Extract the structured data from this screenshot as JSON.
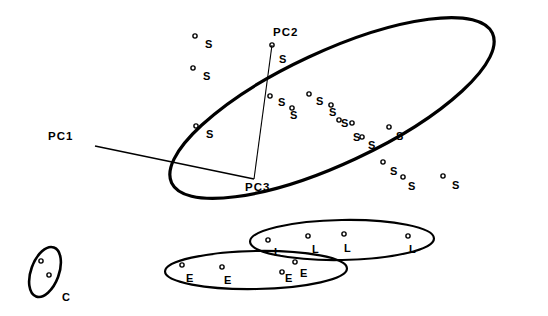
{
  "figure": {
    "background_color": "#ffffff",
    "ink_color": "#000000"
  },
  "axes": [
    {
      "name": "PC1",
      "label": "PC1",
      "label_x": 48,
      "label_y": 131,
      "x1": 95,
      "y1": 146,
      "x2": 254,
      "y2": 179
    },
    {
      "name": "PC2",
      "label": "PC2",
      "label_x": 273,
      "label_y": 27,
      "x1": 272,
      "y1": 45,
      "x2": 254,
      "y2": 179
    },
    {
      "name": "PC3",
      "label": "PC3",
      "label_x": 245,
      "label_y": 182,
      "x1": 254,
      "y1": 179,
      "x2": 254,
      "y2": 179
    }
  ],
  "groups": [
    {
      "name": "spring-group",
      "marker_label": "S",
      "ellipse": {
        "cx": 332,
        "cy": 108,
        "rx": 177,
        "ry": 56,
        "rotation": -25,
        "stroke_width": 3.2
      }
    },
    {
      "name": "late-group",
      "marker_label": "L",
      "ellipse": {
        "cx": 342,
        "cy": 240,
        "rx": 92,
        "ry": 20,
        "rotation": -1,
        "stroke_width": 2.2
      }
    },
    {
      "name": "early-group",
      "marker_label": "E",
      "ellipse": {
        "cx": 256,
        "cy": 270,
        "rx": 91,
        "ry": 19,
        "rotation": -1,
        "stroke_width": 2.2
      }
    },
    {
      "name": "control-group",
      "marker_label": "C",
      "ellipse": {
        "cx": 45,
        "cy": 272,
        "rx": 14,
        "ry": 26,
        "rotation": 20,
        "stroke_width": 2.6
      }
    }
  ],
  "group_labels": [
    {
      "text": "C",
      "x": 62,
      "y": 292,
      "group": "control-group"
    }
  ],
  "chart_data": {
    "type": "scatter",
    "title": "",
    "xlabel": "",
    "ylabel": "",
    "axis_names": [
      "PC1",
      "PC2",
      "PC3"
    ],
    "legend": [
      {
        "code": "S",
        "group": "spring-group"
      },
      {
        "code": "L",
        "group": "late-group"
      },
      {
        "code": "E",
        "group": "early-group"
      },
      {
        "code": "C",
        "group": "control-group"
      }
    ],
    "points": [
      {
        "label": "S",
        "x": 195,
        "y": 36,
        "lx": 205,
        "ly": 39
      },
      {
        "label": "S",
        "x": 193,
        "y": 68,
        "lx": 203,
        "ly": 71
      },
      {
        "label": "S",
        "x": 196,
        "y": 126,
        "lx": 206,
        "ly": 129
      },
      {
        "label": "S",
        "x": 272,
        "y": 45,
        "lx": 279,
        "ly": 54
      },
      {
        "label": "S",
        "x": 270,
        "y": 96,
        "lx": 278,
        "ly": 97
      },
      {
        "label": "S",
        "x": 292,
        "y": 108,
        "lx": 290,
        "ly": 110
      },
      {
        "label": "S",
        "x": 309,
        "y": 94,
        "lx": 316,
        "ly": 96
      },
      {
        "label": "S",
        "x": 331,
        "y": 105,
        "lx": 329,
        "ly": 107
      },
      {
        "label": "S",
        "x": 339,
        "y": 120,
        "lx": 341,
        "ly": 118
      },
      {
        "label": "S",
        "x": 352,
        "y": 123,
        "lx": 353,
        "ly": 132
      },
      {
        "label": "S",
        "x": 362,
        "y": 137,
        "lx": 368,
        "ly": 140
      },
      {
        "label": "S",
        "x": 389,
        "y": 127,
        "lx": 396,
        "ly": 131
      },
      {
        "label": "S",
        "x": 383,
        "y": 162,
        "lx": 390,
        "ly": 166
      },
      {
        "label": "S",
        "x": 403,
        "y": 177,
        "lx": 408,
        "ly": 181
      },
      {
        "label": "S",
        "x": 443,
        "y": 176,
        "lx": 452,
        "ly": 180
      },
      {
        "label": "L",
        "x": 268,
        "y": 240,
        "lx": 274,
        "ly": 247
      },
      {
        "label": "L",
        "x": 308,
        "y": 236,
        "lx": 312,
        "ly": 244
      },
      {
        "label": "L",
        "x": 344,
        "y": 234,
        "lx": 344,
        "ly": 243
      },
      {
        "label": "L",
        "x": 408,
        "y": 236,
        "lx": 409,
        "ly": 244
      },
      {
        "label": "E",
        "x": 182,
        "y": 265,
        "lx": 186,
        "ly": 273
      },
      {
        "label": "E",
        "x": 222,
        "y": 267,
        "lx": 224,
        "ly": 275
      },
      {
        "label": "E",
        "x": 282,
        "y": 272,
        "lx": 285,
        "ly": 273
      },
      {
        "label": "E",
        "x": 295,
        "y": 262,
        "lx": 300,
        "ly": 268
      },
      {
        "label": "C",
        "x": 41,
        "y": 261,
        "lx": 0,
        "ly": 0
      },
      {
        "label": "C",
        "x": 49,
        "y": 275,
        "lx": 0,
        "ly": 0
      }
    ]
  }
}
